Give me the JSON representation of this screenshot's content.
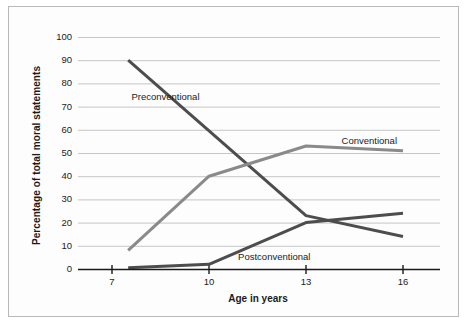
{
  "chart_data": {
    "type": "line",
    "title": "",
    "xlabel": "Age in years",
    "ylabel": "Percentage of total moral statements",
    "xlim": [
      7,
      16.6
    ],
    "ylim": [
      0,
      100
    ],
    "xticks": [
      7,
      10,
      13,
      16
    ],
    "xtick_labels": [
      "7",
      "10",
      "13",
      "16"
    ],
    "yticks": [
      0,
      10,
      20,
      30,
      40,
      50,
      60,
      70,
      80,
      90,
      100
    ],
    "ytick_labels": [
      "0",
      "10",
      "20",
      "30",
      "40",
      "50",
      "60",
      "70",
      "80",
      "90",
      "100"
    ],
    "grid": "horizontal",
    "legend": "inline-annotations",
    "series": [
      {
        "name": "Preconventional",
        "color": "#4d4d4d",
        "label_x": 7.6,
        "label_y": 74,
        "x": [
          7.5,
          13,
          16
        ],
        "values": [
          90,
          23,
          14
        ]
      },
      {
        "name": "Conventional",
        "color": "#8a8a8a",
        "label_x": 14.1,
        "label_y": 55,
        "x": [
          7.5,
          10,
          13,
          16
        ],
        "values": [
          8,
          40,
          53,
          51
        ]
      },
      {
        "name": "Postconventional",
        "color": "#4d4d4d",
        "label_x": 10.9,
        "label_y": 5,
        "x": [
          7.5,
          10,
          13,
          16
        ],
        "values": [
          0.5,
          2,
          20,
          24
        ]
      }
    ]
  },
  "axes": {
    "y_title": "Percentage of total moral statements",
    "x_title": "Age in years"
  },
  "colors": {
    "dark_series": "#4d4d4d",
    "light_series": "#8a8a8a",
    "grid": "#bfbfbf",
    "axis": "#1b1b1b",
    "background": "#fdfdfd",
    "frame": "#b9b9b9"
  }
}
